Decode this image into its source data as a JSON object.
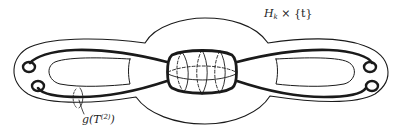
{
  "diagram": {
    "labels": {
      "top_right": "H",
      "top_right_sub": "k",
      "top_right_rest": " × {t}",
      "bottom_left": "g(T",
      "bottom_left_sup": "(2)",
      "bottom_left_rest": ")"
    },
    "colors": {
      "stroke": "#1a1a1a",
      "background": "#ffffff"
    }
  }
}
